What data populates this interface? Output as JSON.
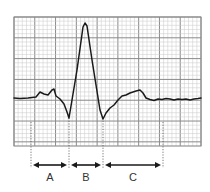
{
  "diagram": {
    "type": "ecg-waveform",
    "grid": {
      "left": 14,
      "top": 17,
      "right": 201,
      "bottom": 146,
      "minor": 4.2,
      "major": 21
    },
    "colors": {
      "grid_minor": "#c8c8c8",
      "grid_major": "#8a8a8a",
      "trace": "#1a1a1a",
      "guide": "#555555"
    },
    "intervals": [
      {
        "label": "A",
        "x_start": 31,
        "x_end": 69,
        "label_x": 50
      },
      {
        "label": "B",
        "x_start": 69,
        "x_end": 103,
        "label_x": 86
      },
      {
        "label": "C",
        "x_start": 103,
        "x_end": 163,
        "label_x": 133
      }
    ],
    "waveform_points": "14,98 20,98.5 28,98 36,97 40,92 44,94 48,95 52,90 54,89 56,96 60,99 64,104 67,112 69,118 77,70 83,27 85,23 87,26 92,60 100,110 103,119 106,113 110,108 114,105 118,100 122,96 126,95 130,93 136,91 140,90 143,93 146,98 150,99.5 154,100.5 158,99 162,99.5 166,98.5 170,99 174,100 178,99 182,99.5 186,99 190,100 194,99 198,98.5 201,98"
  }
}
